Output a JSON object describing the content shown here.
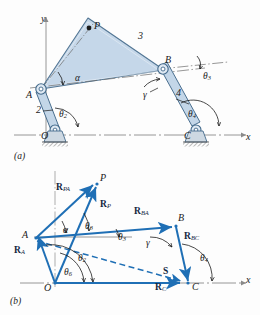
{
  "figure": {
    "captions": {
      "a": "(a)",
      "b": "(b)"
    },
    "colors": {
      "link_fill": "#c3d6e8",
      "link_stroke": "#4a6f8f",
      "vector_blue": "#1f6fb5",
      "axis_gray": "#8a8a8a",
      "ink": "#1a1a1a",
      "ground_hatch": "#555555"
    }
  },
  "diagram_a": {
    "name": "four-bar-linkage",
    "axes": {
      "x_label": "x",
      "y_label": "y"
    },
    "joints": [
      {
        "id": "O",
        "label": "O",
        "type": "ground-pivot"
      },
      {
        "id": "A",
        "label": "A",
        "type": "pin-joint"
      },
      {
        "id": "B",
        "label": "B",
        "type": "pin-joint"
      },
      {
        "id": "C",
        "label": "C",
        "type": "ground-pivot"
      },
      {
        "id": "P",
        "label": "P",
        "type": "coupler-point"
      }
    ],
    "links": [
      {
        "id": "2",
        "label": "2",
        "name": "crank-link"
      },
      {
        "id": "3",
        "label": "3",
        "name": "coupler-link"
      },
      {
        "id": "4",
        "label": "4",
        "name": "rocker-link"
      }
    ],
    "angles": [
      {
        "id": "theta2",
        "label": "θ",
        "sub": "2",
        "name": "crank-angle"
      },
      {
        "id": "theta3",
        "label": "θ",
        "sub": "3",
        "name": "coupler-angle"
      },
      {
        "id": "theta4",
        "label": "θ",
        "sub": "4",
        "name": "rocker-angle"
      },
      {
        "id": "alpha",
        "label": "α",
        "sub": "",
        "name": "coupler-point-angle"
      },
      {
        "id": "gamma",
        "label": "γ",
        "sub": "",
        "name": "transmission-angle"
      }
    ]
  },
  "diagram_b": {
    "name": "vector-loop-diagram",
    "axes": {
      "x_label": "x"
    },
    "points": [
      {
        "id": "O",
        "label": "O"
      },
      {
        "id": "A",
        "label": "A"
      },
      {
        "id": "B",
        "label": "B"
      },
      {
        "id": "C",
        "label": "C"
      },
      {
        "id": "P",
        "label": "P"
      }
    ],
    "vectors": [
      {
        "id": "R_PA",
        "symbol": "R",
        "sub": "PA",
        "name": "vector-r-pa",
        "style": "solid"
      },
      {
        "id": "R_P",
        "symbol": "R",
        "sub": "P",
        "name": "vector-r-p",
        "style": "solid"
      },
      {
        "id": "R_BA",
        "symbol": "R",
        "sub": "BA",
        "name": "vector-r-ba",
        "style": "solid"
      },
      {
        "id": "R_BC",
        "symbol": "R",
        "sub": "BC",
        "name": "vector-r-bc",
        "style": "solid"
      },
      {
        "id": "R_A",
        "symbol": "R",
        "sub": "A",
        "name": "vector-r-a",
        "style": "solid"
      },
      {
        "id": "R_C",
        "symbol": "R",
        "sub": "C",
        "name": "vector-r-c",
        "style": "solid"
      },
      {
        "id": "S",
        "symbol": "S",
        "sub": "",
        "name": "vector-s",
        "style": "dashed"
      }
    ],
    "angles": [
      {
        "id": "alpha",
        "label": "α",
        "sub": "",
        "name": "angle-alpha"
      },
      {
        "id": "theta3",
        "label": "θ",
        "sub": "3",
        "name": "angle-theta3"
      },
      {
        "id": "theta3b",
        "label": "θ",
        "sub": "3",
        "name": "angle-theta3-ba"
      },
      {
        "id": "gamma",
        "label": "γ",
        "sub": "",
        "name": "angle-gamma"
      },
      {
        "id": "theta4",
        "label": "θ",
        "sub": "4",
        "name": "angle-theta4"
      },
      {
        "id": "theta2",
        "label": "θ",
        "sub": "2",
        "name": "angle-theta2"
      },
      {
        "id": "theta6",
        "label": "θ",
        "sub": "6",
        "name": "angle-theta6"
      }
    ]
  }
}
